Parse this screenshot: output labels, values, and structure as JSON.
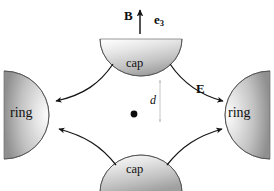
{
  "figure": {
    "background_color": "#ffffff",
    "width": 274,
    "height": 191
  },
  "labels": {
    "ring_left": "ring",
    "ring_right": "ring",
    "cap_top": "cap",
    "cap_bottom": "cap",
    "magnetic_field": "B",
    "basis_vector": "e",
    "basis_vector_subscript": "3",
    "electric_field": "E",
    "distance": "d"
  },
  "colors": {
    "ink": "#101010",
    "shape_light": "#f2f2f2",
    "shape_mid": "#c9c9c9",
    "shape_dark": "#8e8e8e",
    "outline": "#3a3a3a",
    "dimension_arrow": "#bdbdbd"
  },
  "elements": {
    "center_point": {
      "name": "origin-dot",
      "x": 134,
      "y": 114,
      "r": 3.4
    },
    "b_arrow": {
      "from_y": 34,
      "to_y": 10,
      "x": 140
    },
    "d_arrow": {
      "x": 160,
      "from_y": 78,
      "to_y": 124
    },
    "field_lines": [
      {
        "name": "top-left",
        "direction": "toward-left-ring"
      },
      {
        "name": "top-right",
        "direction": "toward-right-ring"
      },
      {
        "name": "bottom-left",
        "direction": "toward-left-ring"
      },
      {
        "name": "bottom-right",
        "direction": "toward-right-ring"
      }
    ]
  }
}
